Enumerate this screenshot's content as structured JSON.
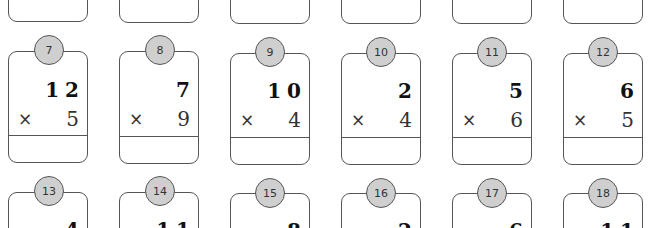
{
  "worksheet": {
    "operator_symbol": "×",
    "rows": [
      {
        "row_index": 1,
        "partially_visible": true,
        "problems": [
          {
            "number": "1"
          },
          {
            "number": "2"
          },
          {
            "number": "3"
          },
          {
            "number": "4"
          },
          {
            "number": "5"
          },
          {
            "number": "6"
          }
        ]
      },
      {
        "row_index": 2,
        "partially_visible": false,
        "problems": [
          {
            "number": "7",
            "multiplicand": "12",
            "multiplier": "5",
            "answer": ""
          },
          {
            "number": "8",
            "multiplicand": "7",
            "multiplier": "9",
            "answer": ""
          },
          {
            "number": "9",
            "multiplicand": "10",
            "multiplier": "4",
            "answer": ""
          },
          {
            "number": "10",
            "multiplicand": "2",
            "multiplier": "4",
            "answer": ""
          },
          {
            "number": "11",
            "multiplicand": "5",
            "multiplier": "6",
            "answer": ""
          },
          {
            "number": "12",
            "multiplicand": "6",
            "multiplier": "5",
            "answer": ""
          }
        ]
      },
      {
        "row_index": 3,
        "partially_visible": true,
        "problems": [
          {
            "number": "13",
            "multiplicand": "4"
          },
          {
            "number": "14",
            "multiplicand": "11"
          },
          {
            "number": "15",
            "multiplicand": "8"
          },
          {
            "number": "16",
            "multiplicand": "2"
          },
          {
            "number": "17",
            "multiplicand": "6"
          },
          {
            "number": "18",
            "multiplicand": "11"
          }
        ]
      }
    ],
    "colors": {
      "badge_fill": "#cfcfcf",
      "border": "#555555",
      "text": "#222222"
    }
  }
}
